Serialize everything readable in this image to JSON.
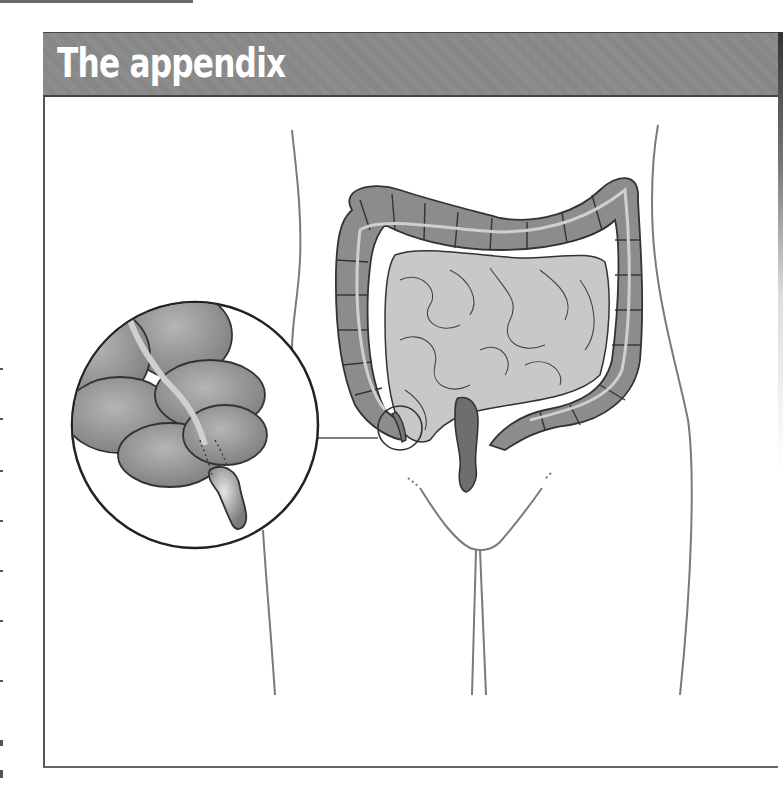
{
  "header": {
    "title": "The appendix"
  },
  "illustration": {
    "subject": "large intestine with appendix, front view of abdomen",
    "inset": "magnified view of the appendix at the cecum",
    "colors": {
      "header_bg": "#8a8a8a",
      "colon": "#8c8c8c",
      "small_intestine": "#c8c8c8",
      "rectum": "#6e6e6e",
      "outline": "#333333",
      "body_outline": "#777777"
    }
  }
}
